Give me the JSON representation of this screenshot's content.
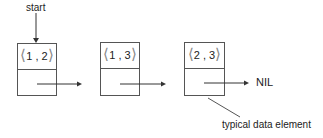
{
  "diagram": {
    "start_label": "start",
    "nil_label": "NIL",
    "annotation": "typical data element",
    "nodes": [
      {
        "value": "1 , 2",
        "open": "⟨",
        "close": "⟩"
      },
      {
        "value": "1 , 3",
        "open": "⟨",
        "close": "⟩"
      },
      {
        "value": "2 , 3",
        "open": "⟨",
        "close": "⟩"
      }
    ],
    "colors": {
      "line": "#333333",
      "brace": "#888888"
    }
  }
}
